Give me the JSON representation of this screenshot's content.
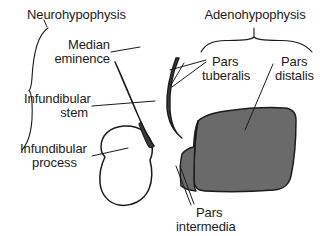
{
  "figure": {
    "background_color": "#ffffff",
    "ink_color": "#1b1b1b",
    "fill_gray": "#6a6a6a",
    "fill_dark": "#3a3a3a"
  },
  "labels": {
    "neurohypophysis": "Neurohypophysis",
    "median_eminence_line1": "Median",
    "median_eminence_line2": "eminence",
    "infundibular_stem_line1": "Infundibular",
    "infundibular_stem_line2": "stem",
    "infundibular_process_line1": "Infundibular",
    "infundibular_process_line2": "process",
    "adenohypophysis": "Adenohypophysis",
    "pars_tuberalis_line1": "Pars",
    "pars_tuberalis_line2": "tuberalis",
    "pars_distalis_line1": "Pars",
    "pars_distalis_line2": "distalis",
    "pars_intermedia_line1": "Pars",
    "pars_intermedia_line2": "intermedia"
  },
  "structures": [
    {
      "name": "median-eminence",
      "label": "Median eminence",
      "group": "neurohypophysis",
      "fill": "#3a3a3a",
      "shape": "elongated tapering sliver angled down-right"
    },
    {
      "name": "infundibular-stem",
      "label": "Infundibular stem",
      "group": "neurohypophysis",
      "fill": "#3a3a3a",
      "shape": "continuation of median eminence sliver"
    },
    {
      "name": "infundibular-process",
      "label": "Infundibular process",
      "group": "neurohypophysis",
      "fill": "#ffffff",
      "shape": "large rounded lobe outline, posterior lobe"
    },
    {
      "name": "pars-tuberalis",
      "label": "Pars tuberalis",
      "group": "adenohypophysis",
      "fill": "#3a3a3a",
      "shape": "thin curved band wrapping the stem"
    },
    {
      "name": "pars-distalis",
      "label": "Pars distalis",
      "group": "adenohypophysis",
      "fill": "#6a6a6a",
      "shape": "large rounded quadrilateral anterior lobe"
    },
    {
      "name": "pars-intermedia",
      "label": "Pars intermedia",
      "group": "adenohypophysis",
      "fill": "#6a6a6a",
      "shape": "narrow strip between posterior lobe and pars distalis"
    }
  ],
  "brackets": [
    {
      "name": "neurohypophysis-brace",
      "label": "Neurohypophysis",
      "orientation": "vertical",
      "members": [
        "Median eminence",
        "Infundibular stem",
        "Infundibular process"
      ]
    },
    {
      "name": "adenohypophysis-brace",
      "label": "Adenohypophysis",
      "orientation": "horizontal",
      "members": [
        "Pars tuberalis",
        "Pars distalis"
      ]
    }
  ]
}
